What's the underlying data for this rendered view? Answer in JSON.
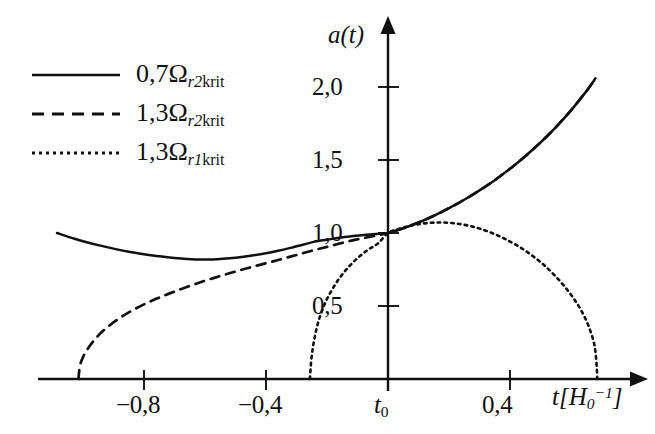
{
  "chart_data": {
    "type": "line",
    "title": "",
    "xlabel": "t[H_0^-1]",
    "ylabel": "a(t)",
    "xlim": [
      -1.08,
      0.87
    ],
    "ylim": [
      0.0,
      2.25
    ],
    "grid": false,
    "legend_position": "upper-left",
    "x_ticks": [
      {
        "value": -0.8,
        "label": "−0,8"
      },
      {
        "value": -0.4,
        "label": "−0,4"
      },
      {
        "value": 0.0,
        "label": "t₀"
      },
      {
        "value": 0.4,
        "label": "0,4"
      }
    ],
    "y_ticks": [
      {
        "value": 0.5,
        "label": "0,5"
      },
      {
        "value": 1.0,
        "label": "1,0"
      },
      {
        "value": 1.5,
        "label": "1,5"
      },
      {
        "value": 2.0,
        "label": "2,0"
      }
    ],
    "annotations": [
      {
        "text": "all three curves pass through (t0, 1,0)",
        "x": 0.0,
        "y": 1.0
      }
    ],
    "series": [
      {
        "name": "0,7Ω_r2krit",
        "style": "solid",
        "color": "#111111",
        "points": [
          [
            -1.085,
            1.0
          ],
          [
            -1.04,
            0.968
          ],
          [
            -1.0,
            0.944
          ],
          [
            -0.95,
            0.917
          ],
          [
            -0.9,
            0.893
          ],
          [
            -0.85,
            0.872
          ],
          [
            -0.8,
            0.855
          ],
          [
            -0.75,
            0.84
          ],
          [
            -0.7,
            0.829
          ],
          [
            -0.66,
            0.822
          ],
          [
            -0.63,
            0.819
          ],
          [
            -0.6,
            0.819
          ],
          [
            -0.56,
            0.821
          ],
          [
            -0.52,
            0.827
          ],
          [
            -0.48,
            0.836
          ],
          [
            -0.44,
            0.848
          ],
          [
            -0.4,
            0.862
          ],
          [
            -0.36,
            0.879
          ],
          [
            -0.32,
            0.898
          ],
          [
            -0.28,
            0.919
          ],
          [
            -0.24,
            0.941
          ],
          [
            -0.2,
            0.954
          ],
          [
            -0.16,
            0.968
          ],
          [
            -0.12,
            0.978
          ],
          [
            -0.08,
            0.986
          ],
          [
            -0.04,
            0.993
          ],
          [
            0.0,
            1.0
          ],
          [
            0.05,
            1.032
          ],
          [
            0.1,
            1.072
          ],
          [
            0.15,
            1.118
          ],
          [
            0.2,
            1.17
          ],
          [
            0.25,
            1.228
          ],
          [
            0.3,
            1.292
          ],
          [
            0.35,
            1.362
          ],
          [
            0.4,
            1.44
          ],
          [
            0.45,
            1.526
          ],
          [
            0.5,
            1.62
          ],
          [
            0.55,
            1.724
          ],
          [
            0.6,
            1.84
          ],
          [
            0.65,
            1.97
          ],
          [
            0.67,
            2.028
          ],
          [
            0.68,
            2.06
          ]
        ]
      },
      {
        "name": "1,3Ω_r2krit",
        "style": "dashed",
        "color": "#111111",
        "points": [
          [
            -1.015,
            0.0
          ],
          [
            -1.01,
            0.09
          ],
          [
            -1.0,
            0.15
          ],
          [
            -0.985,
            0.205
          ],
          [
            -0.965,
            0.262
          ],
          [
            -0.94,
            0.318
          ],
          [
            -0.91,
            0.372
          ],
          [
            -0.875,
            0.424
          ],
          [
            -0.84,
            0.468
          ],
          [
            -0.8,
            0.511
          ],
          [
            -0.76,
            0.549
          ],
          [
            -0.72,
            0.583
          ],
          [
            -0.68,
            0.615
          ],
          [
            -0.64,
            0.645
          ],
          [
            -0.6,
            0.673
          ],
          [
            -0.56,
            0.699
          ],
          [
            -0.52,
            0.724
          ],
          [
            -0.48,
            0.748
          ],
          [
            -0.44,
            0.771
          ],
          [
            -0.4,
            0.793
          ],
          [
            -0.36,
            0.815
          ],
          [
            -0.32,
            0.838
          ],
          [
            -0.28,
            0.861
          ],
          [
            -0.24,
            0.884
          ],
          [
            -0.2,
            0.905
          ],
          [
            -0.16,
            0.927
          ],
          [
            -0.12,
            0.948
          ],
          [
            -0.08,
            0.965
          ],
          [
            -0.04,
            0.982
          ],
          [
            0.0,
            1.0
          ],
          [
            0.05,
            1.032
          ],
          [
            0.1,
            1.072
          ],
          [
            0.15,
            1.118
          ],
          [
            0.2,
            1.17
          ],
          [
            0.25,
            1.228
          ],
          [
            0.3,
            1.292
          ],
          [
            0.35,
            1.362
          ],
          [
            0.4,
            1.44
          ],
          [
            0.45,
            1.526
          ],
          [
            0.5,
            1.62
          ],
          [
            0.55,
            1.724
          ],
          [
            0.6,
            1.84
          ],
          [
            0.65,
            1.97
          ],
          [
            0.67,
            2.028
          ],
          [
            0.68,
            2.06
          ]
        ]
      },
      {
        "name": "1,3Ω_r1krit",
        "style": "dotted",
        "color": "#111111",
        "points": [
          [
            -0.256,
            0.0
          ],
          [
            -0.252,
            0.12
          ],
          [
            -0.246,
            0.22
          ],
          [
            -0.238,
            0.31
          ],
          [
            -0.228,
            0.395
          ],
          [
            -0.215,
            0.475
          ],
          [
            -0.2,
            0.548
          ],
          [
            -0.182,
            0.617
          ],
          [
            -0.162,
            0.682
          ],
          [
            -0.14,
            0.742
          ],
          [
            -0.116,
            0.796
          ],
          [
            -0.09,
            0.846
          ],
          [
            -0.062,
            0.89
          ],
          [
            -0.032,
            0.93
          ],
          [
            0.0,
            1.0
          ],
          [
            0.035,
            1.028
          ],
          [
            0.07,
            1.048
          ],
          [
            0.105,
            1.062
          ],
          [
            0.14,
            1.07
          ],
          [
            0.175,
            1.072
          ],
          [
            0.21,
            1.068
          ],
          [
            0.245,
            1.058
          ],
          [
            0.28,
            1.042
          ],
          [
            0.315,
            1.02
          ],
          [
            0.35,
            0.992
          ],
          [
            0.385,
            0.958
          ],
          [
            0.42,
            0.918
          ],
          [
            0.455,
            0.872
          ],
          [
            0.49,
            0.818
          ],
          [
            0.52,
            0.764
          ],
          [
            0.55,
            0.702
          ],
          [
            0.578,
            0.636
          ],
          [
            0.604,
            0.566
          ],
          [
            0.628,
            0.49
          ],
          [
            0.648,
            0.41
          ],
          [
            0.664,
            0.326
          ],
          [
            0.676,
            0.24
          ],
          [
            0.682,
            0.15
          ],
          [
            0.685,
            0.06
          ],
          [
            0.686,
            0.0
          ]
        ]
      }
    ]
  },
  "legend": {
    "entries": [
      {
        "coefficient": "0,7",
        "symbol": "Ω",
        "subscript": "r2krit",
        "style": "solid"
      },
      {
        "coefficient": "1,3",
        "symbol": "Ω",
        "subscript": "r2krit",
        "style": "dashed"
      },
      {
        "coefficient": "1,3",
        "symbol": "Ω",
        "subscript": "r1krit",
        "style": "dotted"
      }
    ]
  },
  "axes": {
    "y_axis_title": "a(t)",
    "x_axis_title_base": "t[H",
    "x_axis_title_sub": "0",
    "x_axis_title_sup": "−1",
    "x_axis_title_close": "]"
  }
}
